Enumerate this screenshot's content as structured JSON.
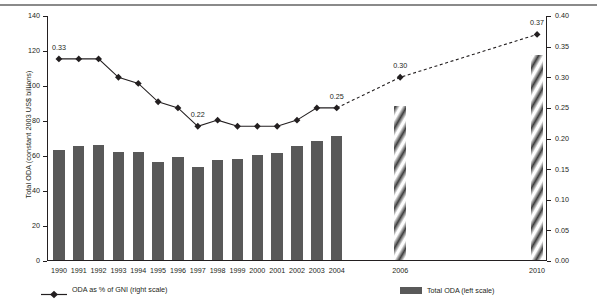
{
  "chart_data": {
    "type": "bar",
    "title": "",
    "subtitle": "",
    "categories": [
      "1990",
      "1991",
      "1992",
      "1993",
      "1994",
      "1995",
      "1996",
      "1997",
      "1998",
      "1999",
      "2000",
      "2001",
      "2002",
      "2003",
      "2004",
      "2006",
      "2010"
    ],
    "xlabel": "",
    "ylabel": "Total ODA (constant 2003 US$ billions)",
    "y2label": "ODA as % of GNI",
    "ylim": [
      0,
      140
    ],
    "y2lim": [
      0,
      0.4
    ],
    "yticks": [
      0,
      20,
      40,
      60,
      80,
      100,
      120,
      140
    ],
    "ytick_labels": [
      "0",
      "20",
      "40",
      "60",
      "80",
      "100",
      "120",
      "140"
    ],
    "y2ticks": [
      0.0,
      0.05,
      0.1,
      0.15,
      0.2,
      0.25,
      0.3,
      0.35,
      0.4
    ],
    "y2tick_labels": [
      "0.00",
      "0.05",
      "0.10",
      "0.15",
      "0.20",
      "0.25",
      "0.30",
      "0.35",
      "0.40"
    ],
    "grid": false,
    "legend_position": "bottom",
    "series": [
      {
        "name": "Total ODA (left scale)",
        "type": "bar",
        "axis": "left",
        "color": "#595959",
        "projection_style": "diagonal-hatch",
        "values": [
          63,
          65,
          66,
          62,
          62,
          56,
          59,
          53,
          57,
          58,
          60,
          61,
          65,
          68,
          71,
          88,
          117
        ],
        "projected": [
          false,
          false,
          false,
          false,
          false,
          false,
          false,
          false,
          false,
          false,
          false,
          false,
          false,
          false,
          false,
          true,
          true
        ]
      },
      {
        "name": "ODA as % of GNI (right scale)",
        "type": "line",
        "axis": "right",
        "color": "#231f20",
        "marker": "diamond",
        "values": [
          0.33,
          0.33,
          0.33,
          0.3,
          0.29,
          0.26,
          0.25,
          0.22,
          0.23,
          0.22,
          0.22,
          0.22,
          0.23,
          0.25,
          0.25,
          0.3,
          0.37
        ],
        "projected_from_index": 14,
        "projected_line_style": "dashed"
      }
    ],
    "annotations": [
      {
        "series": "ODA as % of GNI (right scale)",
        "category": "1990",
        "text": "0.33"
      },
      {
        "series": "ODA as % of GNI (right scale)",
        "category": "1997",
        "text": "0.22"
      },
      {
        "series": "ODA as % of GNI (right scale)",
        "category": "2004",
        "text": "0.25"
      },
      {
        "series": "ODA as % of GNI (right scale)",
        "category": "2006",
        "text": "0.30"
      },
      {
        "series": "ODA as % of GNI (right scale)",
        "category": "2010",
        "text": "0.37"
      }
    ],
    "legend": [
      {
        "label": "ODA as % of GNI (right scale)",
        "marker": "line-diamond",
        "color": "#231f20"
      },
      {
        "label": "Total ODA (left scale)",
        "marker": "bar-swatch",
        "color": "#595959"
      }
    ]
  }
}
